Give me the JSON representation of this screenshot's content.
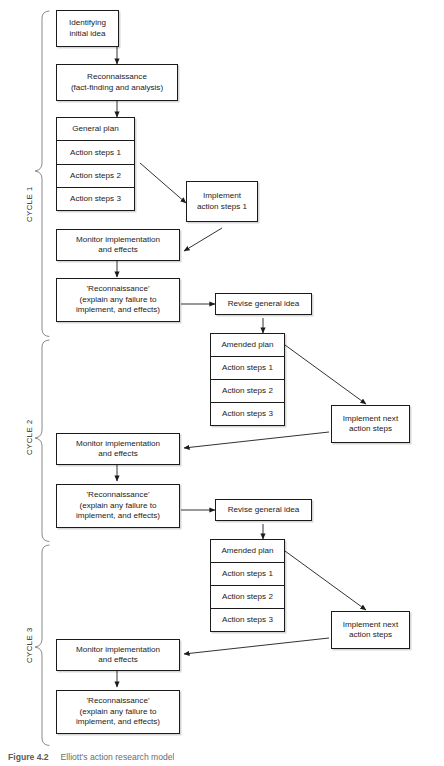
{
  "figure": {
    "type": "flowchart",
    "title": "Elliott's action research model",
    "caption_label": "Figure 4.2",
    "caption_text": "Elliott's action research model"
  },
  "cycles": [
    {
      "id": "cycle-1",
      "label": "CYCLE 1"
    },
    {
      "id": "cycle-2",
      "label": "CYCLE 2"
    },
    {
      "id": "cycle-3",
      "label": "CYCLE 3"
    }
  ],
  "nodes": {
    "identifying_initial_idea": "Identifying\ninitial idea",
    "reconnaissance_fact": "Reconnaissance\n(fact-finding and analysis)",
    "general_plan_title": "General plan",
    "action_step_1": "Action steps 1",
    "action_step_2": "Action steps 2",
    "action_step_3": "Action steps 3",
    "implement_action_steps_1": "Implement\naction steps 1",
    "monitor_implementation": "Monitor implementation\nand effects",
    "reconnaissance_explain": "'Reconnaissance'\n(explain any failure to\nimplement, and effects)",
    "revise_general_idea": "Revise general idea",
    "amended_plan_title": "Amended plan",
    "implement_next_action_steps": "Implement next\naction steps"
  },
  "cycle1": {
    "identifying_initial_idea": "Identifying\ninitial idea",
    "reconnaissance_fact": "Reconnaissance\n(fact-finding and analysis)",
    "plan_title": "General plan",
    "steps": [
      "Action steps 1",
      "Action steps 2",
      "Action steps 3"
    ],
    "implement": "Implement\naction steps 1",
    "monitor": "Monitor implementation\nand effects",
    "reconnaissance": "'Reconnaissance'\n(explain any failure to\nimplement, and effects)",
    "revise": "Revise general idea"
  },
  "cycle2": {
    "plan_title": "Amended plan",
    "steps": [
      "Action steps 1",
      "Action steps 2",
      "Action steps 3"
    ],
    "implement": "Implement next\naction steps",
    "monitor": "Monitor implementation\nand effects",
    "reconnaissance": "'Reconnaissance'\n(explain any failure to\nimplement, and effects)",
    "revise": "Revise general idea"
  },
  "cycle3": {
    "plan_title": "Amended plan",
    "steps": [
      "Action steps 1",
      "Action steps 2",
      "Action steps 3"
    ],
    "implement": "Implement next\naction steps",
    "monitor": "Monitor implementation\nand effects",
    "reconnaissance": "'Reconnaissance'\n(explain any failure to\nimplement, and effects)"
  },
  "colors": {
    "stroke": "#1b1b1b",
    "background": "#ffffff",
    "caption": "#6d6d6d"
  }
}
